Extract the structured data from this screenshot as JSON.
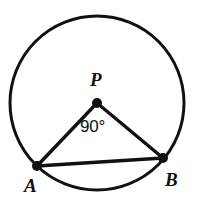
{
  "figure": {
    "background_color": "#ffffff",
    "stroke_color": "#111111",
    "fill_color": "none",
    "stroke_width": 3,
    "canvas": {
      "width": 199,
      "height": 207
    }
  },
  "circle": {
    "name": "circle-P",
    "center": {
      "x": 97,
      "y": 103
    },
    "radius": 87
  },
  "points": [
    {
      "id": "P",
      "label": "P",
      "role": "center",
      "x": 97,
      "y": 103,
      "dot_radius": 5,
      "label_x": 90,
      "label_y": 70
    },
    {
      "id": "A",
      "label": "A",
      "role": "on-circumference",
      "x": 37,
      "y": 166,
      "dot_radius": 5,
      "label_x": 24,
      "label_y": 176
    },
    {
      "id": "B",
      "label": "B",
      "role": "on-circumference",
      "x": 163,
      "y": 158,
      "dot_radius": 5,
      "label_x": 165,
      "label_y": 170
    }
  ],
  "segments": [
    {
      "id": "PA",
      "from": "P",
      "to": "A",
      "kind": "radius",
      "x1": 97,
      "y1": 103,
      "x2": 37,
      "y2": 166
    },
    {
      "id": "PB",
      "from": "P",
      "to": "B",
      "kind": "radius",
      "x1": 97,
      "y1": 103,
      "x2": 163,
      "y2": 158
    },
    {
      "id": "AB",
      "from": "A",
      "to": "B",
      "kind": "chord",
      "x1": 37,
      "y1": 166,
      "x2": 163,
      "y2": 158
    }
  ],
  "annotations": [
    {
      "id": "central-angle",
      "text": "90°",
      "value": 90,
      "unit": "degrees",
      "at_vertex": "P",
      "between": [
        "PA",
        "PB"
      ],
      "x": 80,
      "y": 118
    }
  ]
}
